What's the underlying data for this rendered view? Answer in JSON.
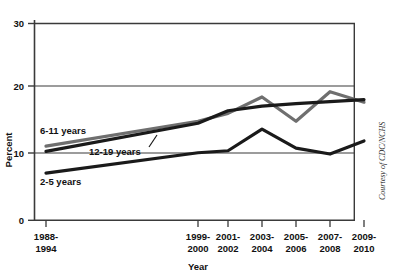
{
  "chart_data": {
    "type": "line",
    "title": "",
    "xlabel": "Year",
    "ylabel": "Percent",
    "ylim": [
      0,
      30
    ],
    "yticks": [
      0,
      10,
      20,
      30
    ],
    "ytick_labels": [
      "0",
      "10",
      "20",
      "30"
    ],
    "grid": true,
    "legend_position": "inline-labels",
    "categories": [
      "1988-\n1994",
      "1999-\n2000",
      "2001-\n2002",
      "2003-\n2004",
      "2005-\n2006",
      "2007-\n2008",
      "2009-\n2010"
    ],
    "xtick_labels_line1": [
      "1988-",
      "1999-",
      "2001-",
      "2003-",
      "2005-",
      "2007-",
      "2009-"
    ],
    "xtick_labels_line2": [
      "1994",
      "2000",
      "2002",
      "2004",
      "2006",
      "2008",
      "2010"
    ],
    "series": [
      {
        "name": "6-11 years",
        "color": "#6f6f6f",
        "values": [
          11.3,
          15.1,
          16.3,
          18.8,
          15.1,
          19.6,
          18.0
        ]
      },
      {
        "name": "12-19 years",
        "color": "#1a1a1a",
        "values": [
          10.5,
          14.8,
          16.7,
          17.4,
          17.8,
          18.1,
          18.4
        ]
      },
      {
        "name": "2-5 years",
        "color": "#1a1a1a",
        "values": [
          7.2,
          10.3,
          10.6,
          13.9,
          11.0,
          10.1,
          12.1
        ]
      }
    ],
    "annotations": [
      {
        "name": "leader-line-12-19",
        "from": [
          158,
          138
        ],
        "to": [
          150,
          128
        ]
      }
    ]
  },
  "labels": {
    "y_axis_title": "Percent",
    "x_axis_title": "Year",
    "series_6_11": "6-11 years",
    "series_12_19": "12-19 years",
    "series_2_5": "2-5 years",
    "credit": "Courtesy of CDC/NCHS",
    "ytick_30": "30",
    "ytick_20": "20",
    "ytick_10": "10",
    "ytick_0": "0"
  },
  "colors": {
    "gray_series": "#6f6f6f",
    "black_series": "#1a1a1a",
    "axis": "#3a3a3a",
    "background": "#ffffff"
  }
}
